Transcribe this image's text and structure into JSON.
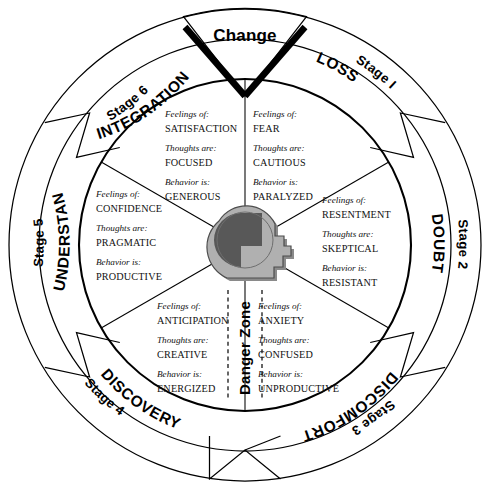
{
  "diagram": {
    "title": "Change",
    "center_icon": "head-profile-icon",
    "danger_zone_label": "Danger Zone",
    "field_labels": {
      "feelings": "Feelings of:",
      "thoughts": "Thoughts are:",
      "behavior": "Behavior is:"
    },
    "colors": {
      "outline": "#000000",
      "background": "#ffffff",
      "head_fill": "#b0b0b0",
      "head_shadow": "#8a8a8a",
      "brain_fill": "#585858"
    },
    "stages": [
      {
        "stage_number": "Stage I",
        "name": "LOSS",
        "feelings": "FEAR",
        "thoughts": "CAUTIOUS",
        "behavior": "PARALYZED"
      },
      {
        "stage_number": "Stage 2",
        "name": "DOUBT",
        "feelings": "RESENTMENT",
        "thoughts": "SKEPTICAL",
        "behavior": "RESISTANT"
      },
      {
        "stage_number": "Stage 3",
        "name": "DISCOMFORT",
        "feelings": "ANXIETY",
        "thoughts": "CONFUSED",
        "behavior": "UNPRODUCTIVE"
      },
      {
        "stage_number": "Stage 4",
        "name": "DISCOVERY",
        "feelings": "ANTICIPATION",
        "thoughts": "CREATIVE",
        "behavior": "ENERGIZED"
      },
      {
        "stage_number": "Stage 5",
        "name": "UNDERSTANDING",
        "feelings": "CONFIDENCE",
        "thoughts": "PRAGMATIC",
        "behavior": "PRODUCTIVE"
      },
      {
        "stage_number": "Stage 6",
        "name": "INTEGRATION",
        "feelings": "SATISFACTION",
        "thoughts": "FOCUSED",
        "behavior": "GENEROUS"
      }
    ]
  }
}
